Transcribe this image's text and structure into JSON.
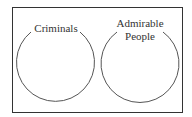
{
  "diagram": {
    "type": "venn",
    "sets": [
      {
        "label_lines": [
          "Criminals"
        ]
      },
      {
        "label_lines": [
          "Admirable",
          "People"
        ]
      }
    ],
    "colors": {
      "stroke": "#444444",
      "border": "#333333",
      "text": "#333333",
      "background": "#ffffff"
    }
  }
}
